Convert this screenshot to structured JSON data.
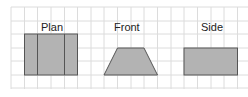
{
  "views": [
    {
      "name": "plan",
      "label": "Plan"
    },
    {
      "name": "front",
      "label": "Front"
    },
    {
      "name": "side",
      "label": "Side"
    }
  ],
  "colors": {
    "grid": "#d9d9d9",
    "fill": "#b3b3b3",
    "stroke": "#555555"
  }
}
